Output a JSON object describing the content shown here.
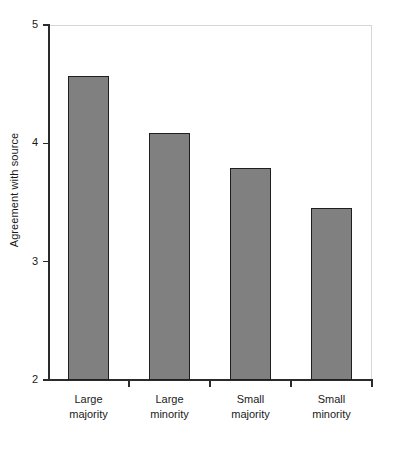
{
  "chart_data": {
    "type": "bar",
    "title": "",
    "subtitle": "",
    "xlabel": "",
    "ylabel": "Agreement with source",
    "categories": [
      "Large majority",
      "Large minority",
      "Small majority",
      "Small minority"
    ],
    "category_lines": [
      [
        "Large",
        "majority"
      ],
      [
        "Large",
        "minority"
      ],
      [
        "Small",
        "majority"
      ],
      [
        "Small",
        "minority"
      ]
    ],
    "values": [
      4.57,
      4.09,
      3.79,
      3.45
    ],
    "ylim": [
      2,
      5
    ],
    "ytick_labels": [
      "5",
      "4",
      "3",
      "2"
    ],
    "ytick_values": [
      5,
      4,
      3,
      2
    ],
    "grid": false,
    "legend": null,
    "legend_position": "none",
    "annotations": [],
    "series": [
      {
        "name": "Agreement with source",
        "values": [
          4.57,
          4.09,
          3.79,
          3.45
        ]
      }
    ]
  },
  "style": {
    "bar_fill": "#808080",
    "bar_border": "#1f1f1f",
    "axis_color": "#2b2b2b",
    "frame_color": "#d6d6d6",
    "background": "#ffffff",
    "text_color": "#1a1a1a"
  }
}
